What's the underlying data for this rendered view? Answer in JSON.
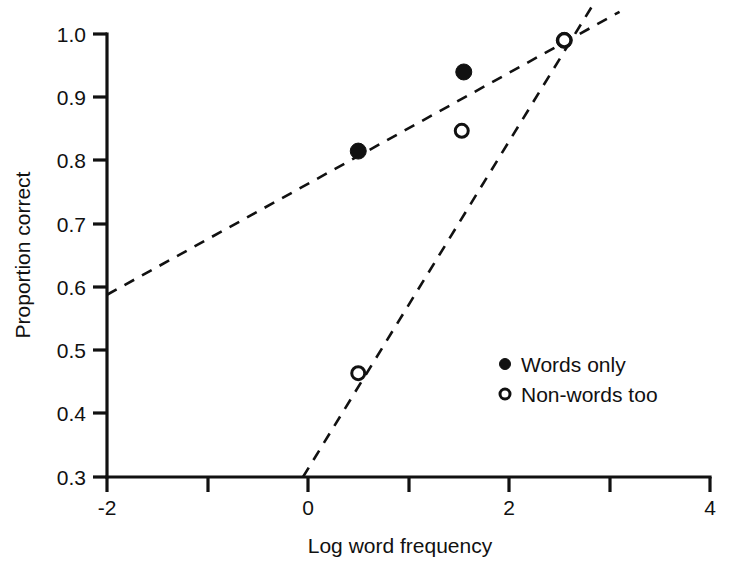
{
  "chart_data": {
    "type": "scatter",
    "title": "",
    "xlabel": "Log word frequency",
    "ylabel": "Proportion correct",
    "xlim": [
      -2,
      4
    ],
    "ylim": [
      0.3,
      1.0
    ],
    "grid": false,
    "legend_position": "center-right",
    "x_ticks_major": [
      "-2",
      "0",
      "2",
      "4"
    ],
    "x_tick_major_values": [
      -2,
      0,
      2,
      4
    ],
    "x_tick_minor_values": [
      -1,
      1,
      3
    ],
    "y_ticks": [
      "0.3",
      "0.4",
      "0.5",
      "0.6",
      "0.7",
      "0.8",
      "0.9",
      "1.0"
    ],
    "y_tick_values": [
      0.3,
      0.4,
      0.5,
      0.6,
      0.7,
      0.8,
      0.9,
      1.0
    ],
    "series": [
      {
        "name": "Words only",
        "marker": "filled-circle",
        "color": "#111111",
        "x": [
          0.5,
          1.55,
          2.55
        ],
        "values": [
          0.815,
          0.94,
          0.99
        ],
        "fit_line": {
          "style": "dashed",
          "x": [
            -2.0,
            3.1
          ],
          "y": [
            0.588,
            1.035
          ]
        }
      },
      {
        "name": "Non-words too",
        "marker": "open-circle",
        "color": "#111111",
        "x": [
          0.5,
          1.53,
          2.55
        ],
        "values": [
          0.464,
          0.847,
          0.99
        ],
        "fit_line": {
          "style": "dashed",
          "x": [
            -0.05,
            2.85
          ],
          "y": [
            0.3,
            1.05
          ]
        }
      }
    ],
    "annotations": []
  },
  "legend": {
    "items": [
      {
        "label": "Words only",
        "marker": "filled-circle"
      },
      {
        "label": "Non-words too",
        "marker": "open-circle"
      }
    ]
  },
  "axes": {
    "y_title": "Proportion correct",
    "x_title": "Log word frequency",
    "y_labels": [
      "1.0",
      "0.9",
      "0.8",
      "0.7",
      "0.6",
      "0.5",
      "0.4",
      "0.3"
    ],
    "x_labels": [
      "-2",
      "0",
      "2",
      "4"
    ]
  }
}
